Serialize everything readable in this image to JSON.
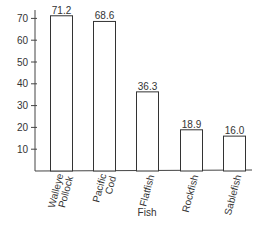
{
  "chart_data": {
    "type": "bar",
    "title": "",
    "xlabel": "Fish",
    "ylabel": "",
    "categories": [
      "Walleye Pollock",
      "Pacific Cod",
      "Flatfish",
      "Rockfish",
      "Sablefish"
    ],
    "category_lines": [
      [
        "Walleye",
        "Pollock"
      ],
      [
        "Pacific",
        "Cod"
      ],
      [
        "Flatfish"
      ],
      [
        "Rockfish"
      ],
      [
        "Sablefish"
      ]
    ],
    "values": [
      71.2,
      68.6,
      36.3,
      18.9,
      16.0
    ],
    "value_labels": [
      "71.2",
      "68.6",
      "36.3",
      "18.9",
      "16.0"
    ],
    "yticks": [
      10,
      20,
      30,
      40,
      50,
      60,
      70
    ],
    "ylim": [
      0,
      72
    ],
    "grid": false,
    "legend": null,
    "bar_fill": "#ffffff",
    "bar_stroke": "#333333"
  }
}
